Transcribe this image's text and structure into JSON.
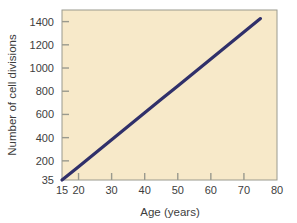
{
  "chart_data": {
    "type": "line",
    "title": "",
    "xlabel": "Age (years)",
    "ylabel": "Number of cell divisions",
    "xlim": [
      15,
      80
    ],
    "ylim": [
      35,
      1500
    ],
    "grid": false,
    "legend": null,
    "xticks": [
      15,
      20,
      30,
      40,
      50,
      60,
      70,
      80
    ],
    "xtick_labels": [
      "15",
      "20",
      "30",
      "40",
      "50",
      "60",
      "70",
      "80"
    ],
    "yticks": [
      35,
      200,
      400,
      600,
      800,
      1000,
      1200,
      1400
    ],
    "ytick_labels": [
      "35",
      "200",
      "400",
      "600",
      "800",
      "1000",
      "1200",
      "1400"
    ],
    "series": [
      {
        "name": "Cell divisions vs age",
        "color": "#30306a",
        "x": [
          15,
          20,
          25,
          30,
          35,
          40,
          45,
          50,
          55,
          60,
          65,
          70,
          75
        ],
        "values": [
          35,
          150,
          266,
          382,
          498,
          614,
          730,
          846,
          962,
          1078,
          1194,
          1310,
          1426
        ]
      }
    ]
  },
  "colors": {
    "plot_background": "#f7e9c9",
    "page_background": "#ffffff",
    "line": "#30306a",
    "axis": "#9a9a8e",
    "text": "#3d3d3d"
  },
  "axis_titles": {
    "x": "Age (years)",
    "y": "Number of cell divisions"
  }
}
